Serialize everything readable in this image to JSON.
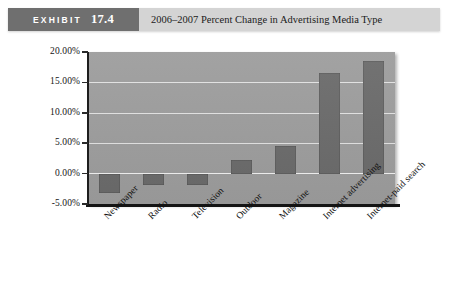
{
  "header": {
    "tag_keyword": "EXHIBIT",
    "tag_number": "17.4",
    "title": "2006–2007 Percent Change in Advertising Media Type",
    "tag_bg_color": "#6f6f6f",
    "bar_bg_color": "#d4d4d4"
  },
  "chart_data": {
    "type": "bar",
    "title": "2006–2007 Percent Change in Advertising Media Type",
    "xlabel": "",
    "ylabel": "",
    "categories": [
      "Newspaper",
      "Radio",
      "Television",
      "Outdoor",
      "Magazine",
      "Internet advertising",
      "Internet-paid search"
    ],
    "values": [
      -3.2,
      -1.8,
      -1.9,
      2.3,
      4.5,
      16.5,
      18.6
    ],
    "value_labels": [
      "-3.20%",
      "-1.80%",
      "-1.90%",
      "2.30%",
      "4.50%",
      "16.50%",
      "18.60%"
    ],
    "ylim": [
      -5,
      20
    ],
    "ytick_values": [
      20,
      15,
      10,
      5,
      0,
      -5
    ],
    "ytick_labels": [
      "20.00%",
      "15.00%",
      "10.00%",
      "5.00%",
      "0.00%",
      "-5.00%"
    ],
    "grid": true,
    "grid_axis": "y",
    "legend": false,
    "legend_position": "none",
    "bar_color": "#6b6b6b",
    "plot_bg_color": "#9d9d9d",
    "gridline_color": "#e2e2e2",
    "axis_color": "#141414"
  }
}
